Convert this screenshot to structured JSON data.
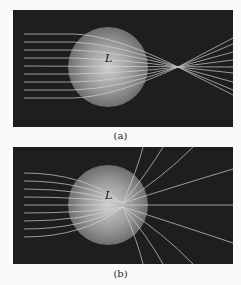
{
  "figure": {
    "panels": [
      {
        "caption": "(a)",
        "label": "L",
        "description": "parallel rays focused through spherical lens to a focal point"
      },
      {
        "caption": "(b)",
        "label": "L",
        "description": "parallel rays bent strongly, diverging radially from lens center"
      }
    ],
    "colors": {
      "background": "#1e1e1e",
      "ray": "#d8d8d8",
      "lens_center": "#d0d0d0",
      "lens_edge": "#6a6a6a"
    }
  }
}
